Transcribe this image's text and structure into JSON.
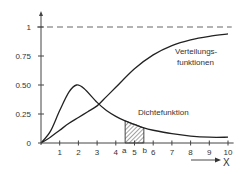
{
  "chart_data": {
    "type": "line",
    "title": "",
    "xlabel": "X",
    "ylabel": "",
    "xlim": [
      0,
      10
    ],
    "ylim": [
      0,
      1
    ],
    "x_ticks": [
      1,
      2,
      3,
      4,
      5,
      6,
      7,
      8,
      9,
      10
    ],
    "y_ticks": [
      0,
      0.25,
      0.5,
      0.75,
      1
    ],
    "y_tick_labels": [
      "0",
      "0.25",
      "0.50",
      "0.75",
      "1"
    ],
    "asymptote": {
      "y": 1,
      "style": "dashed"
    },
    "series": [
      {
        "name": "Verteilungsfunktionen",
        "kind": "cdf",
        "x": [
          0,
          0.5,
          1,
          1.5,
          2,
          2.5,
          3,
          3.5,
          4,
          5,
          6,
          7,
          8,
          9,
          10
        ],
        "y": [
          0,
          0.05,
          0.11,
          0.17,
          0.22,
          0.27,
          0.32,
          0.4,
          0.48,
          0.64,
          0.76,
          0.84,
          0.89,
          0.92,
          0.94
        ]
      },
      {
        "name": "Dichtefunktion",
        "kind": "pdf",
        "x": [
          0,
          0.5,
          1,
          1.5,
          1.9,
          2.3,
          3,
          3.5,
          4,
          4.5,
          5,
          5.5,
          6,
          7,
          8,
          9,
          10
        ],
        "y": [
          0,
          0.1,
          0.28,
          0.44,
          0.5,
          0.47,
          0.35,
          0.28,
          0.23,
          0.19,
          0.16,
          0.13,
          0.11,
          0.08,
          0.06,
          0.05,
          0.05
        ]
      }
    ],
    "shaded_interval": {
      "a": 4.5,
      "b": 5.5,
      "a_label": "a",
      "b_label": "b",
      "under": "Dichtefunktion",
      "pattern": "hatched"
    },
    "annotations": [
      {
        "text": "Verteilungs-",
        "near": "cdf-upper-right"
      },
      {
        "text": "funktionen",
        "near": "cdf-upper-right"
      },
      {
        "text": "Dichtefunktion",
        "near": "pdf-right"
      }
    ]
  }
}
